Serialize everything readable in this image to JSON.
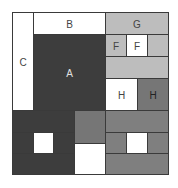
{
  "diagram": {
    "labels": {
      "a": "A",
      "b": "B",
      "c": "C",
      "f_left": "F",
      "f_right": "F",
      "g": "G",
      "h_left": "H",
      "h_right": "H"
    },
    "colors": {
      "white": "#ffffff",
      "dark": "#3d3d3d",
      "light_gray": "#bdbdbd",
      "medium_gray": "#767676",
      "border": "#3a3a3a"
    }
  }
}
